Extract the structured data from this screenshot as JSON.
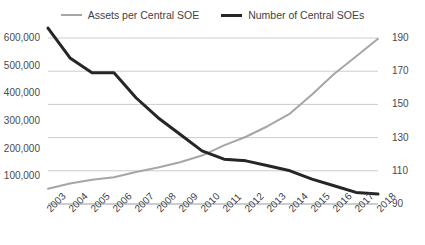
{
  "chart_data": {
    "type": "line",
    "title": "",
    "xlabel": "",
    "grid": true,
    "legend_position": "top-center",
    "categories": [
      "2003",
      "2004",
      "2005",
      "2006",
      "2007",
      "2008",
      "2009",
      "2010",
      "2011",
      "2012",
      "2013",
      "2014",
      "2015",
      "2016",
      "2017",
      "2018"
    ],
    "axes": {
      "left": {
        "label": "Assets per Central SOE",
        "ylim": [
          0,
          600000
        ],
        "ticks": [
          "100,000",
          "200,000",
          "300,000",
          "400,000",
          "500,000",
          "600,000"
        ],
        "tick_values": [
          100000,
          200000,
          300000,
          400000,
          500000,
          600000
        ],
        "color": "#a6a6a6"
      },
      "right": {
        "label": "Number of Central SOEs",
        "ylim": [
          90,
          190
        ],
        "ticks": [
          "90",
          "110",
          "130",
          "150",
          "170",
          "190"
        ],
        "tick_values": [
          90,
          110,
          130,
          150,
          170,
          190
        ],
        "color": "#262626"
      }
    },
    "series": [
      {
        "name": "Assets per Central SOE",
        "axis": "left",
        "color": "#a6a6a6",
        "width": 2,
        "values": [
          55000,
          74000,
          88000,
          97000,
          116000,
          132000,
          151000,
          175000,
          212000,
          243000,
          282000,
          327000,
          396000,
          470000,
          533000,
          597000
        ]
      },
      {
        "name": "Number of Central SOEs",
        "axis": "right",
        "color": "#262626",
        "width": 3,
        "values": [
          196,
          178,
          169,
          169,
          154,
          142,
          132,
          122,
          117,
          116,
          113,
          110,
          105,
          101,
          97,
          96
        ]
      }
    ]
  },
  "legend": {
    "items": [
      {
        "label": "Assets per Central SOE",
        "color": "#a6a6a6",
        "style": "thin"
      },
      {
        "label": "Number of Central SOEs",
        "color": "#262626",
        "style": "thick"
      }
    ]
  },
  "colors": {
    "background": "#ffffff",
    "grid": "#bfbfbf",
    "axis": "#9a9a9a",
    "text": "#3f3f3f",
    "assets_line": "#a6a6a6",
    "count_line": "#262626"
  }
}
